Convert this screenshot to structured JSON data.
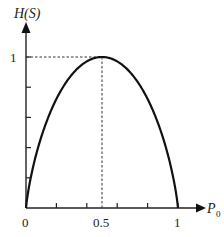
{
  "chart_data": {
    "type": "line",
    "title": "",
    "xlabel": "P0",
    "ylabel": "H(S)",
    "xlim": [
      0,
      1
    ],
    "ylim": [
      0,
      1
    ],
    "x_ticks": [
      0,
      0.2,
      0.4,
      0.6,
      0.8,
      1
    ],
    "x_tick_labels": [
      "0",
      "0.5",
      "1"
    ],
    "y_ticks": [
      0.2,
      0.4,
      0.6,
      0.8,
      1
    ],
    "y_tick_labels": [
      "1"
    ],
    "grid": false,
    "series": [
      {
        "name": "H(S) binary entropy",
        "x": [
          0,
          0.05,
          0.1,
          0.2,
          0.3,
          0.4,
          0.5,
          0.6,
          0.7,
          0.8,
          0.9,
          0.95,
          1
        ],
        "values": [
          0,
          0.286,
          0.469,
          0.722,
          0.881,
          0.971,
          1,
          0.971,
          0.881,
          0.722,
          0.469,
          0.286,
          0
        ]
      }
    ],
    "annotations": [
      {
        "type": "dashed-line",
        "description": "horizontal from y-axis to peak at H=1"
      },
      {
        "type": "dashed-line",
        "description": "vertical from peak down to x=0.5"
      }
    ]
  },
  "labels": {
    "y_axis": "H(S)",
    "x_axis_main": "P",
    "x_axis_sub": "0",
    "x_origin": "0",
    "x_mid": "0.5",
    "x_end": "1",
    "y_top": "1"
  },
  "colors": {
    "axis": "#222222",
    "curve": "#111111",
    "dashed": "#333333"
  }
}
